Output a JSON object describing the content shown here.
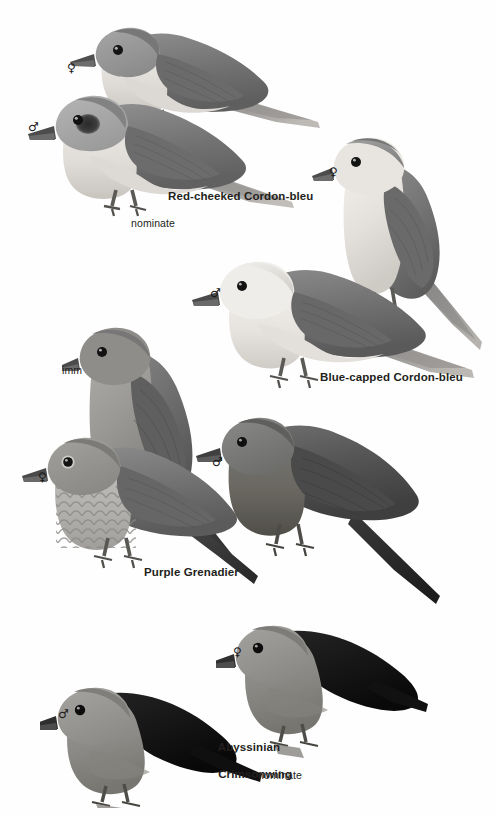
{
  "page": {
    "kind": "field-guide-plate",
    "background": "#fefefe",
    "ink": "#231f20",
    "width": 496,
    "height": 816
  },
  "species": [
    {
      "id": "red-cheeked-cordon-bleu",
      "name": "Red-cheeked Cordon-bleu",
      "subtitle": "nominate",
      "name_pos": {
        "x": 168,
        "y": 190
      },
      "subtitle_pos": {
        "x": 131,
        "y": 217
      },
      "figures": [
        {
          "sex": "female",
          "symbol": "♀",
          "sym_pos": {
            "x": 67,
            "y": 62
          }
        },
        {
          "sex": "male",
          "symbol": "♂",
          "sym_pos": {
            "x": 28,
            "y": 121
          }
        }
      ]
    },
    {
      "id": "blue-capped-cordon-bleu",
      "name": "Blue-capped Cordon-bleu",
      "subtitle": "",
      "name_pos": {
        "x": 320,
        "y": 371
      },
      "subtitle_pos": null,
      "figures": [
        {
          "sex": "female",
          "symbol": "♀",
          "sym_pos": {
            "x": 329,
            "y": 166
          }
        },
        {
          "sex": "male",
          "symbol": "♂",
          "sym_pos": {
            "x": 210,
            "y": 287
          }
        }
      ]
    },
    {
      "id": "purple-grenadier",
      "name": "Purple Grenadier",
      "subtitle": "imm",
      "name_pos": {
        "x": 144,
        "y": 566
      },
      "subtitle_pos": {
        "x": 62,
        "y": 364
      },
      "figures": [
        {
          "sex": "immature",
          "symbol": "",
          "sym_pos": null
        },
        {
          "sex": "female",
          "symbol": "♀",
          "sym_pos": {
            "x": 38,
            "y": 471
          }
        },
        {
          "sex": "male",
          "symbol": "♂",
          "sym_pos": {
            "x": 212,
            "y": 456
          }
        }
      ]
    },
    {
      "id": "abyssinian-crimsonwing",
      "name": "Abyssinian\nCrimsonwing",
      "name_line1": "Abyssinian",
      "name_line2": "Crimsonwing",
      "subtitle": "nominate",
      "name_pos": {
        "x": 205,
        "y": 727
      },
      "subtitle_pos": {
        "x": 258,
        "y": 769
      },
      "figures": [
        {
          "sex": "female",
          "symbol": "♀",
          "sym_pos": {
            "x": 233,
            "y": 646
          }
        },
        {
          "sex": "male",
          "symbol": "♂",
          "sym_pos": {
            "x": 58,
            "y": 708
          }
        }
      ]
    }
  ],
  "palette": {
    "upper_dark": "#6f6f6f",
    "upper_mid": "#8a8a8a",
    "under_pale": "#d8d6d2",
    "under_light": "#eceae6",
    "head_grey": "#9a9a9a",
    "wing_black": "#1d1d1d",
    "bill": "#4a4a4a",
    "eye": "#141414",
    "leg": "#5e5c58",
    "tail_grey": "#7d7d7d",
    "outline": "#55534f"
  }
}
